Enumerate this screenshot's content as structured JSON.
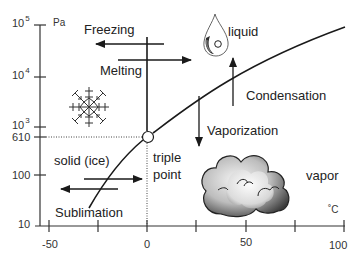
{
  "diagram": {
    "y_axis": {
      "unit": "Pa",
      "scale": "log",
      "ticks": [
        {
          "base": "10",
          "exp": "5",
          "value": 100000
        },
        {
          "base": "10",
          "exp": "4",
          "value": 10000
        },
        {
          "base": "10",
          "exp": "3",
          "value": 1000
        },
        {
          "label": "610",
          "value": 610
        },
        {
          "label": "100",
          "value": 100
        },
        {
          "label": "10",
          "value": 10
        }
      ]
    },
    "x_axis": {
      "unit": "˚C",
      "labeled_ticks": [
        "-50",
        "0",
        "50",
        "100"
      ],
      "tick_values": [
        -50,
        -25,
        0,
        25,
        50,
        75,
        100
      ]
    },
    "regions": {
      "solid": "solid (ice)",
      "liquid": "liquid",
      "vapor": "vapor"
    },
    "triple_point": {
      "label_line1": "triple",
      "label_line2": "point",
      "temperature_c": 0,
      "pressure_pa": 610
    },
    "transitions": {
      "freezing": "Freezing",
      "melting": "Melting",
      "condensation": "Condensation",
      "vaporization": "Vaporization",
      "sublimation": "Sublimation"
    },
    "icons": {
      "solid": "snowflake-icon",
      "liquid": "water-drop-icon",
      "vapor": "cloud-icon"
    },
    "colors": {
      "line": "#1a1a1a",
      "axis": "#333333",
      "background": "#ffffff"
    }
  }
}
